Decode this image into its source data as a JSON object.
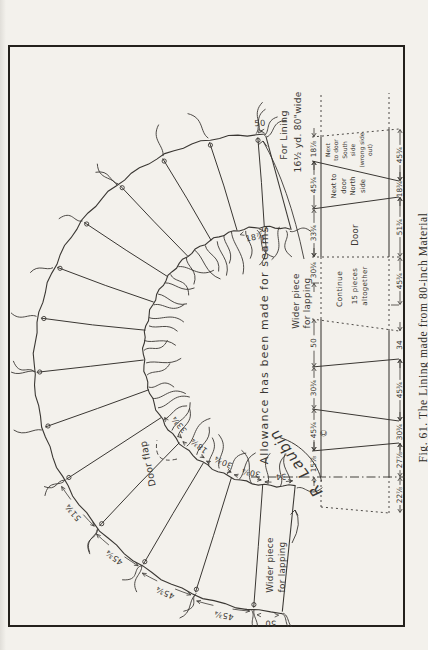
{
  "page": {
    "paper": "#f3f1ec",
    "ink": "#3a3733",
    "frame": "#24211c"
  },
  "caption": {
    "text": "Fig. 61. The Lining made from 80-inch Material"
  },
  "fan": {
    "panel_count": 15,
    "door_flap": "Door flap",
    "allowance_note": "Allowance has been made for seams",
    "lining_note": [
      "For Lining",
      "16½ yd. 80\"wide"
    ],
    "lapping_note_door_end": [
      "Wider piece",
      "for lapping"
    ],
    "lapping_note_far_end": [
      "Wider piece",
      "for lapping"
    ],
    "signature": "R. Laubin",
    "copyright": "©",
    "outer_dims": [
      {
        "panel": 0,
        "text": "50"
      },
      {
        "panel": 1,
        "text": "45¾"
      },
      {
        "panel": 2,
        "text": "45¾"
      },
      {
        "panel": 3,
        "text": "45¾"
      },
      {
        "panel": 4,
        "text": "51¾"
      },
      {
        "panel": 14,
        "text": "50"
      }
    ],
    "inner_dims": [
      {
        "panel": 0,
        "text": "34"
      },
      {
        "panel": 1,
        "text": "30¾"
      },
      {
        "panel": 2,
        "text": "30¾"
      },
      {
        "panel": 3,
        "text": "18¾"
      },
      {
        "panel": 4,
        "text": "33¾"
      },
      {
        "panel": 13,
        "text": "18⅞"
      }
    ]
  },
  "strip": {
    "door_label": "Door",
    "north_label": [
      "Next to",
      "door",
      "North",
      "side"
    ],
    "south_label": [
      "Next",
      "to door",
      "South",
      "side",
      "(wrong side",
      "out)"
    ],
    "continue_note": [
      "Continue",
      "15 pieces",
      "altogether"
    ],
    "top_dims": [
      "15⅞",
      "45¾",
      "30¾",
      "50",
      "30¾",
      "33¾",
      "45¾",
      "18⅞"
    ],
    "bottom_dims": [
      "22⅞",
      "27⅞",
      "30¾",
      "45¾",
      "34",
      "45¾",
      "51¾",
      "18¾",
      "45¾"
    ]
  }
}
